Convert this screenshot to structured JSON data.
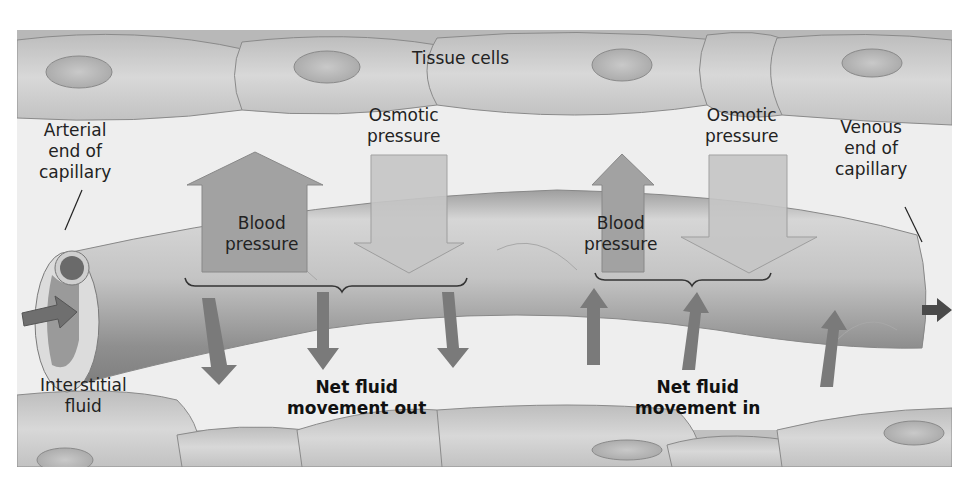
{
  "figure": {
    "title_label": "Tissue cells",
    "arterial_label": [
      "Arterial",
      "end of",
      "capillary"
    ],
    "venous_label": [
      "Venous",
      "end of",
      "capillary"
    ],
    "interstitial_label": [
      "Interstitial",
      "fluid"
    ],
    "arterial_side": {
      "blood_pressure_label": [
        "Blood",
        "pressure"
      ],
      "osmotic_pressure_label": [
        "Osmotic",
        "pressure"
      ],
      "net_movement_label": [
        "Net fluid",
        "movement out"
      ]
    },
    "venous_side": {
      "blood_pressure_label": [
        "Blood",
        "pressure"
      ],
      "osmotic_pressure_label": [
        "Osmotic",
        "pressure"
      ],
      "net_movement_label": [
        "Net fluid",
        "movement in"
      ]
    },
    "colors": {
      "background": "#eeeeee",
      "cell": "#c8c8c8",
      "cell_nucleus": "#b4b4b4",
      "capillary": "#b9b9b9",
      "blood_pressure_arrow": "#9a9a9a",
      "osmotic_arrow": "#c4c4c4",
      "fluid_arrow": "#7a7a7a",
      "text": "#222222"
    }
  }
}
